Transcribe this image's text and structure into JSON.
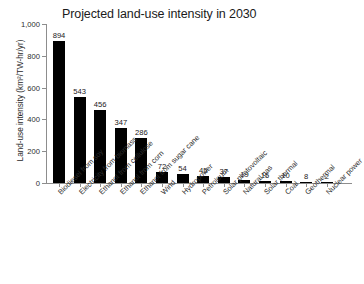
{
  "chart_data": {
    "type": "bar",
    "title": "Projected land-use intensity in 2030",
    "xlabel": "",
    "ylabel": "Land-use intensity (km²/TW-hr/yr)",
    "ylim": [
      0,
      1000
    ],
    "yticks": [
      "0",
      "200",
      "400",
      "600",
      "800",
      "1,000"
    ],
    "ytick_values": [
      0,
      200,
      400,
      600,
      800,
      1000
    ],
    "grid": false,
    "legend": "none",
    "bar_color": "#000000",
    "axis_color": "#8d8d8d",
    "categories": [
      "Biodiesel from soy",
      "Electricity from biomass",
      "Ethanol from cellulose",
      "Ethanol from corn",
      "Ethanol from sugar cane",
      "Wind",
      "Hydropower",
      "Petroleum",
      "Solar photovoltaic",
      "Natural gas",
      "Solar thermal",
      "Coal",
      "Geothermal",
      "Nuclear power"
    ],
    "values": [
      894,
      543,
      456,
      347,
      286,
      72,
      54,
      45,
      37,
      19,
      15,
      10,
      8,
      2
    ],
    "value_labels": [
      "894",
      "543",
      "456",
      "347",
      "286",
      "72",
      "54",
      "45",
      "37",
      "19",
      "15",
      "10",
      "8",
      "2"
    ]
  }
}
